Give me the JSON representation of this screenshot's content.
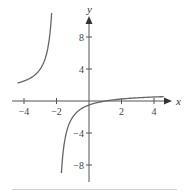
{
  "chart_data": {
    "type": "line",
    "title": "",
    "xlabel": "x",
    "ylabel": "y",
    "xlim": [
      -5.2,
      5.5
    ],
    "ylim": [
      -11,
      12
    ],
    "grid": false,
    "legend": null,
    "x_ticks": [
      -4,
      -2,
      2,
      4
    ],
    "x_tick_labels": [
      "−4",
      "−2",
      "2",
      "4"
    ],
    "y_ticks": [
      8,
      4,
      -4,
      -8
    ],
    "y_tick_labels": [
      "8",
      "4",
      "−4",
      "−8"
    ],
    "series": [
      {
        "name": "left branch",
        "x": [
          -4.4,
          -4.0,
          -3.5,
          -3.0,
          -2.6,
          -2.4,
          -2.3
        ],
        "values": [
          2.25,
          2.5,
          3.0,
          4.0,
          6.0,
          8.5,
          11.0
        ]
      },
      {
        "name": "right branch",
        "x": [
          -1.7,
          -1.5,
          -1.0,
          -0.5,
          0,
          1,
          2,
          3,
          4,
          4.6
        ],
        "values": [
          -9.0,
          -5.0,
          -2.0,
          -1.0,
          -0.5,
          0,
          0.25,
          0.4,
          0.5,
          0.55
        ]
      }
    ],
    "annotations": []
  },
  "axes": {
    "x_label": "x",
    "y_label": "y"
  }
}
